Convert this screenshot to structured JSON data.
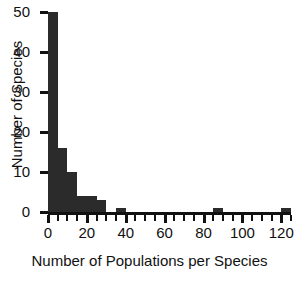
{
  "chart_data": {
    "type": "bar",
    "title": "",
    "subtitle": "",
    "xlabel": "Number of Populations per Species",
    "ylabel": "Number of Species",
    "xlim": [
      0,
      125
    ],
    "ylim": [
      0,
      50
    ],
    "grid": false,
    "legend": null,
    "bin_width": 5,
    "xticks": [
      0,
      20,
      40,
      60,
      80,
      100,
      120
    ],
    "xtick_labels": [
      "0",
      "20",
      "40",
      "60",
      "80",
      "100",
      "120"
    ],
    "xminor_tick_step": 5,
    "yticks": [
      0,
      10,
      20,
      30,
      40,
      50
    ],
    "ytick_labels": [
      "0",
      "10",
      "20",
      "30",
      "40",
      "50"
    ],
    "bins": [
      {
        "start": 0,
        "end": 5,
        "value": 50
      },
      {
        "start": 5,
        "end": 10,
        "value": 16
      },
      {
        "start": 10,
        "end": 15,
        "value": 10
      },
      {
        "start": 15,
        "end": 20,
        "value": 4
      },
      {
        "start": 20,
        "end": 25,
        "value": 4
      },
      {
        "start": 25,
        "end": 30,
        "value": 3
      },
      {
        "start": 35,
        "end": 40,
        "value": 1
      },
      {
        "start": 85,
        "end": 90,
        "value": 1
      },
      {
        "start": 120,
        "end": 125,
        "value": 1
      }
    ],
    "categories": [
      "0-5",
      "5-10",
      "10-15",
      "15-20",
      "20-25",
      "25-30",
      "35-40",
      "85-90",
      "120-125"
    ],
    "values": [
      50,
      16,
      10,
      4,
      4,
      3,
      1,
      1,
      1
    ],
    "colors": {
      "bar": "#2b2b2b",
      "axis": "#111111",
      "background": "#ffffff",
      "text": "#111111"
    }
  }
}
